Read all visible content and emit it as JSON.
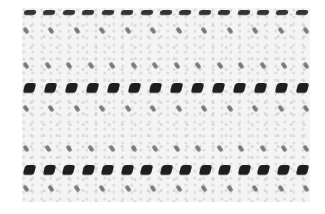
{
  "image": {
    "subject": "crocheted fabric texture",
    "description": "Close-up of white crochet fabric with three horizontal rows of dark open holes and intermediate rows of small dark stitch marks",
    "colors": {
      "fabric": "#f4f4f4",
      "holes": "#1e1e1e",
      "background": "#ffffff"
    },
    "rows": [
      {
        "type": "top",
        "y": 12,
        "count": 15
      },
      {
        "type": "light",
        "y": 30,
        "count": 12
      },
      {
        "type": "light",
        "y": 65,
        "count": 14
      },
      {
        "type": "dark",
        "y": 88,
        "count": 14
      },
      {
        "type": "light",
        "y": 108,
        "count": 12
      },
      {
        "type": "light",
        "y": 148,
        "count": 14
      },
      {
        "type": "dark",
        "y": 170,
        "count": 15
      },
      {
        "type": "light",
        "y": 188,
        "count": 12
      }
    ]
  }
}
